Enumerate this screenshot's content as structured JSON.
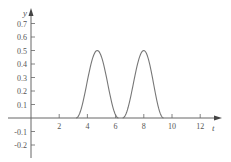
{
  "chart_data": {
    "type": "line",
    "title": "",
    "xlabel": "t",
    "ylabel": "y",
    "xlim": [
      -2,
      13
    ],
    "ylim": [
      -0.25,
      0.8
    ],
    "x_ticks": [
      2,
      4,
      6,
      8,
      10,
      12
    ],
    "x_tick_labels": [
      "2",
      "4",
      "6",
      "8",
      "10",
      "12"
    ],
    "y_ticks": [
      -0.2,
      -0.1,
      0.1,
      0.2,
      0.3,
      0.4,
      0.5,
      0.6,
      0.7
    ],
    "y_tick_labels": [
      "-0.2",
      "-0.1",
      "0.1",
      "0.2",
      "0.3",
      "0.4",
      "0.5",
      "0.6",
      "0.7"
    ],
    "grid": false,
    "legend": null,
    "series": [
      {
        "name": "y(t)",
        "description": "Two smooth bumps, each peaking at 0.5; zero elsewhere",
        "bumps": [
          {
            "start": 3.2,
            "peak": 4.7,
            "end": 6.2,
            "height": 0.5
          },
          {
            "start": 6.5,
            "peak": 8.0,
            "end": 9.4,
            "height": 0.5
          }
        ],
        "color": "#777777"
      }
    ]
  }
}
